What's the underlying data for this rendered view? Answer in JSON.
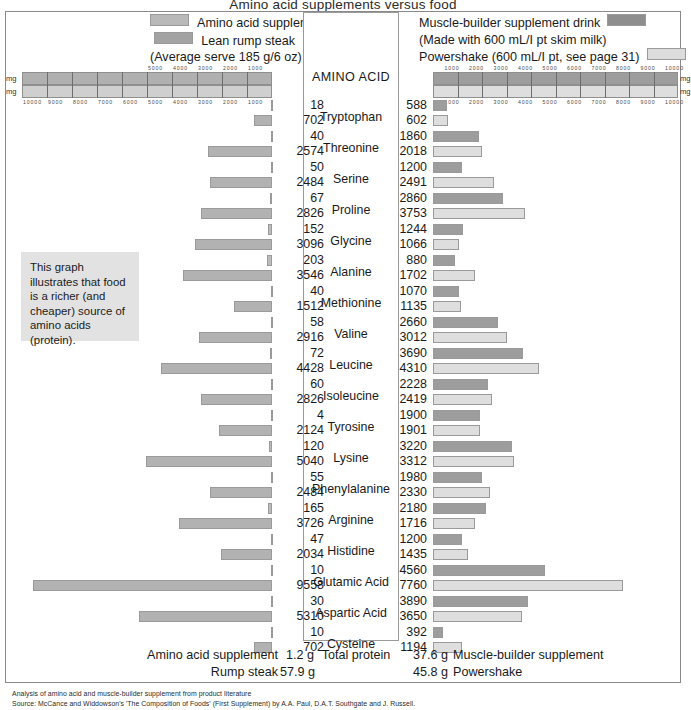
{
  "title": "Amino acid supplements versus food",
  "legend": {
    "left": {
      "series1": "Amino acid supplement",
      "series2": "Lean rump steak",
      "note": "(Average serve 185 g/6 oz)",
      "color1": "#bcbcbc",
      "color2": "#b2b2b2"
    },
    "right": {
      "series1": "Muscle-builder supplement drink",
      "note": "(Made with 600 mL/I pt skim milk)",
      "series2": "Powershake (600 mL/I pt, see page 31)",
      "color1": "#9d9d9d",
      "color2": "#dedede"
    }
  },
  "center_header": "AMINO ACID",
  "axes": {
    "left_unit_top": "mg",
    "left_unit_bottom": "mg",
    "right_unit_top": "mg",
    "right_unit_bottom": "mg",
    "left_top_ticks": [
      "5000",
      "4000",
      "3000",
      "2000",
      "1000"
    ],
    "left_bottom_ticks": [
      "10000",
      "9000",
      "8000",
      "7000",
      "6000",
      "5000",
      "4000",
      "3000",
      "2000",
      "1000"
    ],
    "right_top_ticks": [
      "1000",
      "2000",
      "3000",
      "4000",
      "5000",
      "6000",
      "7000",
      "8000",
      "9000",
      "10000"
    ],
    "right_bottom_ticks": [
      "1000",
      "2000",
      "3000",
      "4000",
      "5000",
      "6000",
      "7000",
      "8000",
      "9000",
      "10000"
    ]
  },
  "callout": "This graph illustrates that food is a richer (and cheaper) source of amino acids (protein).",
  "chart_data": {
    "type": "bar",
    "title": "Amino acid supplements versus food",
    "xlabel": "mg",
    "ylabel": "AMINO ACID",
    "orientation": "horizontal-bidirectional",
    "left_axis_range": [
      0,
      10000
    ],
    "right_axis_range": [
      0,
      10000
    ],
    "left_axis_direction": "right-to-left",
    "right_axis_direction": "left-to-right",
    "grid": true,
    "legend_position": "top",
    "categories": [
      "Tryptophan",
      "Threonine",
      "Serine",
      "Proline",
      "Glycine",
      "Alanine",
      "Methionine",
      "Valine",
      "Leucine",
      "Isoleucine",
      "Tyrosine",
      "Lysine",
      "Phenylalanine",
      "Arginine",
      "Histidine",
      "Glutamic Acid",
      "Aspartic Acid",
      "Cysteine"
    ],
    "series": [
      {
        "name": "Amino acid supplement",
        "side": "left",
        "color": "#bcbcbc",
        "values": [
          18,
          40,
          50,
          67,
          152,
          203,
          40,
          58,
          72,
          60,
          4,
          120,
          55,
          165,
          47,
          10,
          30,
          10
        ]
      },
      {
        "name": "Lean rump steak",
        "side": "left",
        "color": "#b2b2b2",
        "values": [
          702,
          2574,
          2484,
          2826,
          3096,
          3546,
          1512,
          2916,
          4428,
          2826,
          2124,
          5040,
          2484,
          3726,
          2034,
          9558,
          5310,
          702
        ]
      },
      {
        "name": "Muscle-builder supplement drink",
        "side": "right",
        "color": "#9d9d9d",
        "values": [
          588,
          1860,
          1200,
          2860,
          1244,
          880,
          1070,
          2660,
          3690,
          2228,
          1900,
          3220,
          1980,
          2180,
          1200,
          4560,
          3890,
          392
        ]
      },
      {
        "name": "Powershake",
        "side": "right",
        "color": "#dedede",
        "values": [
          602,
          2018,
          2491,
          3753,
          1066,
          1702,
          1135,
          3012,
          4310,
          2419,
          1901,
          3312,
          2330,
          1716,
          1435,
          7760,
          3650,
          1194
        ]
      }
    ]
  },
  "totals": {
    "label_left1": "Amino acid supplement",
    "value_left1": "1.2 g",
    "label_left2": "Rump steak",
    "value_left2": "57.9 g",
    "center_label": "Total protein",
    "value_right1": "37.6 g",
    "label_right1": "Muscle-builder supplement",
    "value_right2": "45.8 g",
    "label_right2": "Powershake"
  },
  "footnotes": {
    "line1": "Analysis of amino acid and muscle-builder supplement from product literature",
    "line2": "Source: McCance and Widdowson's 'The Composition of Foods' (First Supplement) by A.A. Paul, D.A.T. Southgate and J. Russell."
  }
}
